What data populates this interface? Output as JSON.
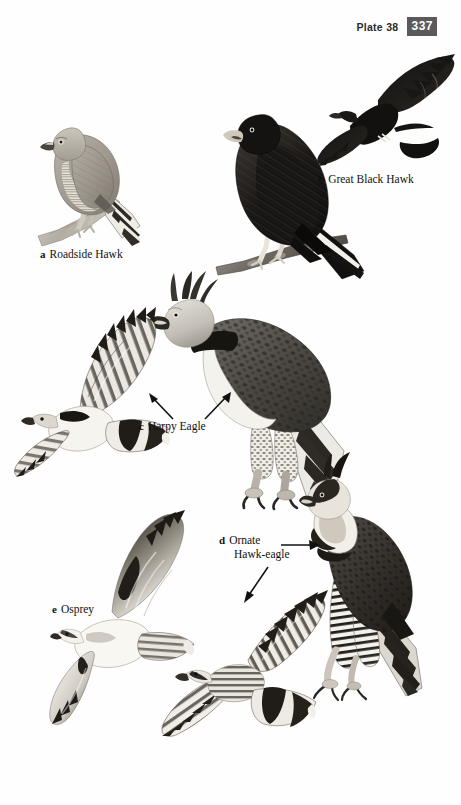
{
  "header": {
    "plate_label": "Plate 38",
    "page_number": "337",
    "page_number_bg": "#5a5a5a",
    "page_number_color": "#ffffff"
  },
  "plate": {
    "title": "Plate 38",
    "background": "#ffffff",
    "ink": "#1a1a1a"
  },
  "species": [
    {
      "key": "a",
      "name": "Roadside Hawk",
      "caption": "Roadside Hawk",
      "figures": [
        "perched"
      ],
      "tone": "pale grey-brown",
      "notes": "perched on branch, banded tail"
    },
    {
      "key": "b",
      "name": "Great Black Hawk",
      "caption": "Great Black Hawk",
      "figures": [
        "perched",
        "flight"
      ],
      "tone": "blackish",
      "notes": "white tail band, pale cere"
    },
    {
      "key": "c",
      "name": "Harpy Eagle",
      "caption": "Harpy Eagle",
      "figures": [
        "perched",
        "flight"
      ],
      "tone": "grey and white",
      "notes": "double crest, black breast band, barred tail"
    },
    {
      "key": "d",
      "name": "Ornate Hawk-eagle",
      "caption_line1": "Ornate",
      "caption_line2": "Hawk-eagle",
      "figures": [
        "perched",
        "flight"
      ],
      "tone": "black, white and barred",
      "notes": "long black crest, barred underparts and tail"
    },
    {
      "key": "e",
      "name": "Osprey",
      "caption": "Osprey",
      "figures": [
        "flight"
      ],
      "tone": "white and dark brown",
      "notes": "dark carpal patches, crooked wings"
    }
  ],
  "pointers": [
    {
      "name": "harpy-left-arrow",
      "target": "Harpy Eagle flight figure",
      "direction": "up-left"
    },
    {
      "name": "harpy-right-arrow",
      "target": "Harpy Eagle perched figure",
      "direction": "up-right"
    },
    {
      "name": "ornate-right-arrow",
      "target": "Ornate Hawk-eagle perched figure",
      "direction": "right"
    },
    {
      "name": "ornate-down-arrow",
      "target": "Ornate Hawk-eagle flight figure",
      "direction": "down-left"
    }
  ]
}
